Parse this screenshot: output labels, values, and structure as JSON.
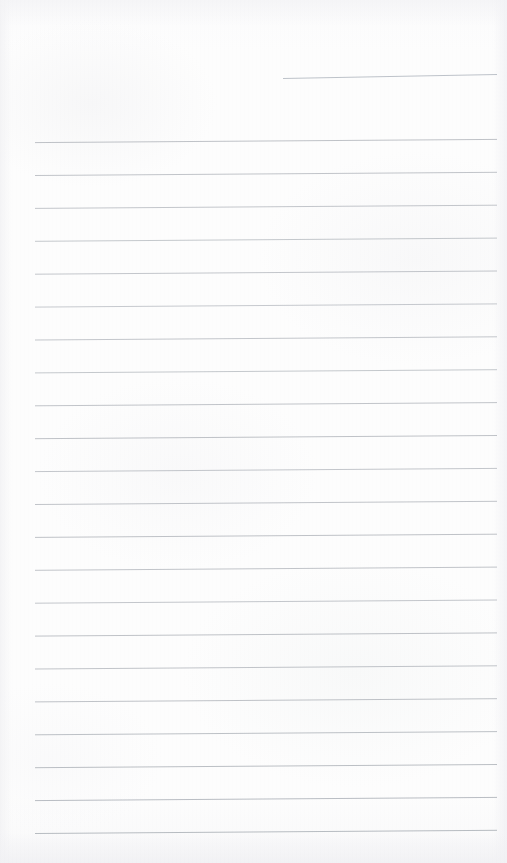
{
  "page": {
    "kind": "scanned-lined-notebook-page",
    "width": 507,
    "height": 863,
    "paper_color": "#fdfdfd",
    "rule_color": "#9aa0a8",
    "header_rule_color": "#9aa3ad",
    "text_content": "",
    "has_visible_text": false
  },
  "header_rule": {
    "name": "date-rule",
    "x_start": 283,
    "x_end": 497,
    "y_start": 78.5,
    "y_end": 74.5,
    "stroke_width": 0.9,
    "opacity": 0.72
  },
  "ruling": {
    "count": 22,
    "x_start": 35,
    "x_end": 497,
    "first_y": 142,
    "spacing": 32.9,
    "tilt_rise": 3.2,
    "stroke_width": 0.9,
    "lines": [
      {
        "index": 1,
        "y_left": 142.6,
        "y_right": 139.4,
        "opacity": 0.7
      },
      {
        "index": 2,
        "y_left": 175.5,
        "y_right": 172.3,
        "opacity": 0.68
      },
      {
        "index": 3,
        "y_left": 208.4,
        "y_right": 205.2,
        "opacity": 0.66
      },
      {
        "index": 4,
        "y_left": 241.3,
        "y_right": 238.1,
        "opacity": 0.64
      },
      {
        "index": 5,
        "y_left": 274.2,
        "y_right": 271.0,
        "opacity": 0.66
      },
      {
        "index": 6,
        "y_left": 307.1,
        "y_right": 303.9,
        "opacity": 0.62
      },
      {
        "index": 7,
        "y_left": 340.0,
        "y_right": 336.8,
        "opacity": 0.66
      },
      {
        "index": 8,
        "y_left": 372.9,
        "y_right": 369.7,
        "opacity": 0.64
      },
      {
        "index": 9,
        "y_left": 405.8,
        "y_right": 402.6,
        "opacity": 0.68
      },
      {
        "index": 10,
        "y_left": 438.7,
        "y_right": 435.5,
        "opacity": 0.7
      },
      {
        "index": 11,
        "y_left": 471.6,
        "y_right": 468.4,
        "opacity": 0.66
      },
      {
        "index": 12,
        "y_left": 504.5,
        "y_right": 501.3,
        "opacity": 0.68
      },
      {
        "index": 13,
        "y_left": 537.4,
        "y_right": 534.2,
        "opacity": 0.7
      },
      {
        "index": 14,
        "y_left": 570.3,
        "y_right": 567.1,
        "opacity": 0.68
      },
      {
        "index": 15,
        "y_left": 603.2,
        "y_right": 600.0,
        "opacity": 0.66
      },
      {
        "index": 16,
        "y_left": 636.1,
        "y_right": 632.9,
        "opacity": 0.7
      },
      {
        "index": 17,
        "y_left": 669.0,
        "y_right": 665.8,
        "opacity": 0.68
      },
      {
        "index": 18,
        "y_left": 701.9,
        "y_right": 698.7,
        "opacity": 0.7
      },
      {
        "index": 19,
        "y_left": 734.8,
        "y_right": 731.6,
        "opacity": 0.72
      },
      {
        "index": 20,
        "y_left": 767.7,
        "y_right": 764.5,
        "opacity": 0.74
      },
      {
        "index": 21,
        "y_left": 800.6,
        "y_right": 797.4,
        "opacity": 0.76
      },
      {
        "index": 22,
        "y_left": 833.5,
        "y_right": 830.3,
        "opacity": 0.78
      }
    ]
  }
}
